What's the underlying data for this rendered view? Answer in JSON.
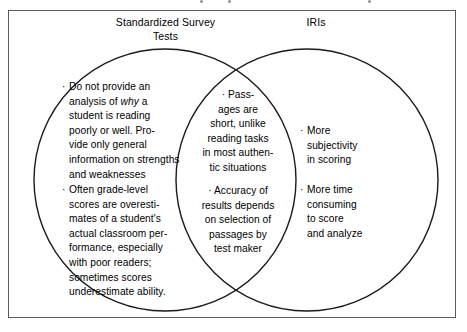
{
  "figure": {
    "type": "venn-diagram",
    "sets": 2,
    "frame_color": "#5d5d5d",
    "circle_color": "#1a1a1a",
    "background": "#ffffff"
  },
  "headers": {
    "left": "Standardized Survey\nTests",
    "right": "IRIs"
  },
  "bullet_glyph": "·",
  "left_circle": {
    "name": "Standardized Survey Tests",
    "bullets": [
      {
        "id": "no-analysis-of-why",
        "pre_italic": "Do not provide an\nanalysis of ",
        "italic": "why",
        "post_italic": " a\nstudent is reading\npoorly or well. Pro-\nvide only general\ninformation on strengths\nand weaknesses",
        "plain": "Do not provide an analysis of why a student is reading poorly or well. Provide only general information on strengths and weaknesses"
      },
      {
        "id": "grade-level-overestimates",
        "text": "Often grade-level\nscores are overesti-\nmates of a student's\nactual classroom per-\nformance, especially\nwith poor readers;\nsometimes scores\nunderestimate ability."
      }
    ]
  },
  "overlap": {
    "name": "Shared characteristics",
    "bullets": [
      {
        "id": "short-passages",
        "text": "Pass-\nages are\nshort, unlike\nreading tasks\nin most authen-\ntic situations"
      },
      {
        "id": "accuracy-depends-on-passages",
        "text": "Accuracy of\nresults depends\non selection of\npassages by\ntest maker"
      }
    ]
  },
  "right_circle": {
    "name": "IRIs",
    "bullets": [
      {
        "id": "more-subjectivity",
        "text": "More\nsubjectivity\nin scoring"
      },
      {
        "id": "more-time-consuming",
        "text": "More time\nconsuming\nto score\nand analyze"
      }
    ]
  }
}
